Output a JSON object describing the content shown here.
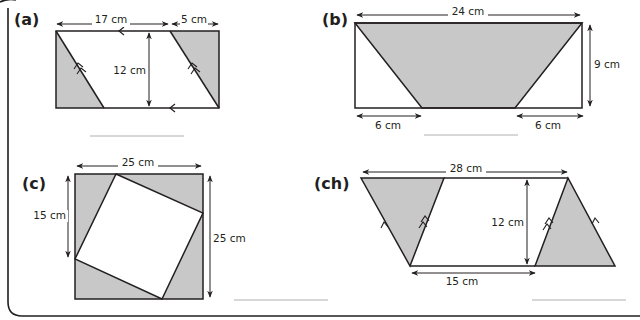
{
  "worksheet": {
    "frame": {
      "border_color": "#231f20"
    },
    "colors": {
      "shade": "#c8c8c8",
      "stroke": "#231f20",
      "answer_line": "#b0b0b0"
    },
    "problems": [
      {
        "id": "a",
        "label": "(a)",
        "dimensions": {
          "top_left": "17 cm",
          "top_right": "5 cm",
          "height": "12 cm"
        },
        "answer": ""
      },
      {
        "id": "b",
        "label": "(b)",
        "dimensions": {
          "top": "24 cm",
          "height": "9 cm",
          "bottom_left": "6 cm",
          "bottom_right": "6 cm"
        },
        "answer": ""
      },
      {
        "id": "c",
        "label": "(c)",
        "dimensions": {
          "top": "25 cm",
          "left": "15 cm",
          "right": "25 cm"
        },
        "answer": ""
      },
      {
        "id": "ch",
        "label": "(ch)",
        "dimensions": {
          "top": "28 cm",
          "height": "12 cm",
          "bottom": "15 cm"
        },
        "answer": ""
      }
    ]
  }
}
